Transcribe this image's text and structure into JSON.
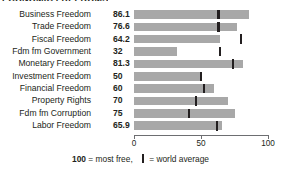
{
  "title": "ECONOMIC FREEDOMS",
  "axis": {
    "ticks": [
      {
        "value": 0,
        "label": "0"
      },
      {
        "value": 50,
        "label": "50"
      },
      {
        "value": 100,
        "label": "100"
      }
    ],
    "min": 0,
    "max": 100
  },
  "footnote": {
    "most_free_number": "100",
    "most_free_text": " = most free,",
    "average_text": " = world average",
    "marker_icon": "world-average-tick-icon"
  },
  "colors": {
    "bar": "#a8a8a8",
    "tick": "#231f20",
    "axis": "#6d6e71",
    "text": "#231f20",
    "background": "#ffffff"
  },
  "chart_data": {
    "type": "bar",
    "orientation": "horizontal",
    "title": "ECONOMIC FREEDOMS",
    "xlabel": "",
    "ylabel": "",
    "xlim": [
      0,
      100
    ],
    "grid": false,
    "legend": "100 = most free, | = world average",
    "categories": [
      "Business Freedom",
      "Trade Freedom",
      "Fiscal Freedom",
      "Fdm fm Government",
      "Monetary Freedom",
      "Investment Freedom",
      "Financial Freedom",
      "Property Rights",
      "Fdm fm Corruption",
      "Labor Freedom"
    ],
    "value_labels": [
      "86.1",
      "76.6",
      "64.2",
      "32",
      "81.3",
      "50",
      "60",
      "70",
      "75",
      "65.9"
    ],
    "series": [
      {
        "name": "Country score",
        "values": [
          86.1,
          76.6,
          64.2,
          32,
          81.3,
          50,
          60,
          70,
          75,
          65.9
        ]
      },
      {
        "name": "World average",
        "marker": "tick",
        "values": [
          63,
          63,
          80,
          64,
          74,
          50,
          52,
          46,
          41,
          62
        ]
      }
    ]
  }
}
